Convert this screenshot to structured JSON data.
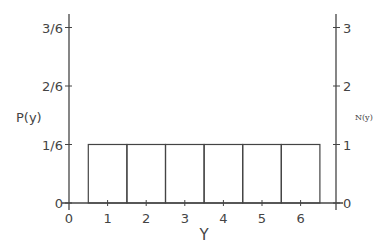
{
  "chart_data": {
    "type": "bar",
    "title": "",
    "xlabel": "Y",
    "ylabel": "P(y)",
    "ylabel_right": "N(y)",
    "categories": [
      "1",
      "2",
      "3",
      "4",
      "5",
      "6"
    ],
    "values": [
      0.1667,
      0.1667,
      0.1667,
      0.1667,
      0.1667,
      0.1667
    ],
    "counts": [
      1,
      1,
      1,
      1,
      1,
      1
    ],
    "x_ticks": [
      "0",
      "1",
      "2",
      "3",
      "4",
      "5",
      "6"
    ],
    "y_ticks_left": [
      "0",
      "1/6",
      "2/6",
      "3/6"
    ],
    "y_ticks_right": [
      "0",
      "1",
      "2",
      "3"
    ],
    "ylim": [
      0,
      0.5
    ],
    "ylim_right": [
      0,
      3
    ],
    "grid": false,
    "legend": null
  }
}
